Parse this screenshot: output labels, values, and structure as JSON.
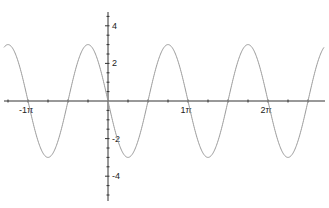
{
  "chart_data": {
    "type": "line",
    "title": "",
    "xlabel": "",
    "ylabel": "",
    "function": "y = -3 sin(2x)",
    "series": [
      {
        "name": "y = -3 sin(2x)",
        "amplitude": 3,
        "period": "π",
        "x": [
          -1.25,
          -1.0,
          -0.75,
          -0.5,
          -0.25,
          0,
          0.25,
          0.5,
          0.75,
          1.0,
          1.25,
          1.5,
          1.75,
          2.0,
          2.25,
          2.5
        ],
        "x_units": "π",
        "values": [
          -3,
          0,
          3,
          0,
          3,
          0,
          -3,
          0,
          3,
          0,
          -3,
          0,
          3,
          0,
          -3,
          0
        ]
      }
    ],
    "x_ticks": [
      {
        "value": -1,
        "label": "-1π"
      },
      {
        "value": 1,
        "label": "1π"
      },
      {
        "value": 2,
        "label": "2π"
      }
    ],
    "y_ticks": [
      {
        "value": 4,
        "label": "4"
      },
      {
        "value": 2,
        "label": "2"
      },
      {
        "value": -2,
        "label": "-2"
      },
      {
        "value": -4,
        "label": "-4"
      }
    ],
    "xlim": [
      -1.35,
      2.65
    ],
    "ylim": [
      -5.2,
      4.7
    ],
    "grid": false,
    "legend": "none",
    "colors": {
      "curve": "#9a9a9a",
      "axis": "#333333"
    }
  }
}
